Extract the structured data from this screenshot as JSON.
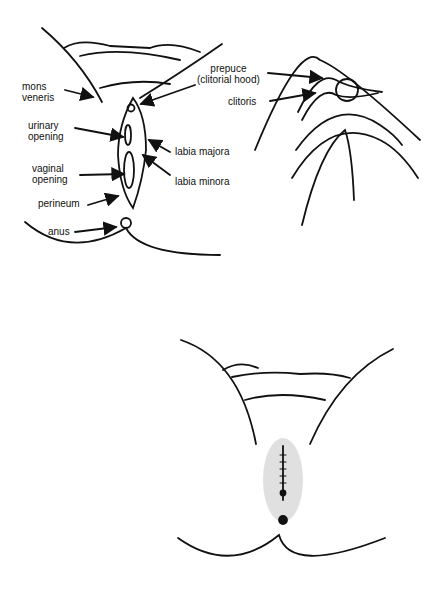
{
  "figure": {
    "panels": [
      {
        "id": "panel-a",
        "description": "Labeled external anatomy diagram",
        "labels": {
          "mons": "mons\nveneris",
          "urinary": "urinary\nopening",
          "vaginal": "vaginal\nopening",
          "perineum": "perineum",
          "anus": "anus",
          "prepuce": "prepuce\n(clitorial hood)",
          "labia_majora": "labia majora",
          "labia_minora": "labia minora"
        }
      },
      {
        "id": "panel-b",
        "description": "Close-up detail",
        "labels": {
          "clitoris": "clitoris"
        }
      },
      {
        "id": "panel-c",
        "description": "Unlabeled clinical illustration"
      }
    ],
    "colors": {
      "ink": "#111111",
      "background": "#ffffff",
      "shade": "#cccccc"
    }
  }
}
